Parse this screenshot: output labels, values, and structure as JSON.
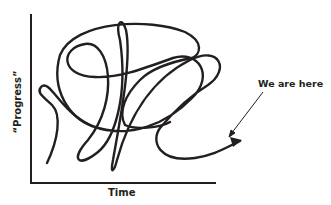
{
  "diagram": {
    "x_axis_label": "Time",
    "y_axis_label": "“Progress”",
    "annotation": "We are here",
    "colors": {
      "line": "#231f20",
      "background": "#ffffff"
    }
  }
}
